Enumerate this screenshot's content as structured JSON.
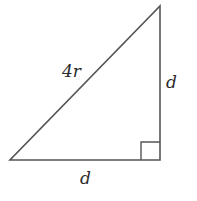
{
  "diagram": {
    "type": "right-triangle",
    "stroke_color": "#555555",
    "label_color": "#2a2a2a",
    "vertices": {
      "left": [
        10,
        160
      ],
      "right_angle": [
        160,
        160
      ],
      "top": [
        160,
        6
      ]
    },
    "labels": {
      "hypotenuse": "4r",
      "vertical_leg": "d",
      "horizontal_leg": "d"
    },
    "right_angle_marker": true
  }
}
